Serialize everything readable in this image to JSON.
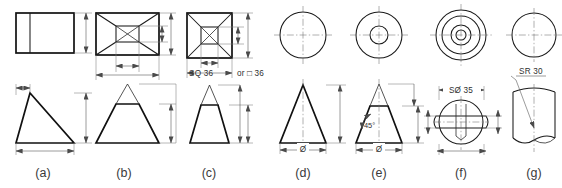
{
  "sheet": {
    "title": "Dimensioning of solids - orthographic views",
    "width": 562,
    "height": 188,
    "background": "#ffffff",
    "line_color": "#1a1a1a",
    "dim_color": "#4a4a4a",
    "center_color": "#6f6f6f"
  },
  "panels": [
    {
      "key": "a",
      "caption": "(a)",
      "solid": "oblique-prism",
      "top_view": "rectangle-with-vertical-edge",
      "front_view": "scalene-triangle",
      "dimensions": []
    },
    {
      "key": "b",
      "caption": "(b)",
      "solid": "truncated-rectangular-pyramid",
      "top_view": "rectangle-with-inner-rectangle-and-diagonals",
      "front_view": "trapezoid-with-apex-construction",
      "dimensions": []
    },
    {
      "key": "c",
      "caption": "(c)",
      "solid": "truncated-square-pyramid",
      "top_view": "square-with-inner-square-and-diagonals",
      "front_view": "trapezoid-with-apex-construction",
      "dimensions": [
        {
          "name": "square-size",
          "text": "SQ 36"
        },
        {
          "name": "alternate-note",
          "text": "or"
        },
        {
          "name": "square-symbol-size",
          "text": "□ 36"
        }
      ]
    },
    {
      "key": "d",
      "caption": "(d)",
      "solid": "cone",
      "top_view": "circle",
      "front_view": "isosceles-triangle",
      "dimensions": [
        {
          "name": "base-diameter",
          "text": "Ø"
        }
      ]
    },
    {
      "key": "e",
      "caption": "(e)",
      "solid": "truncated-cone",
      "top_view": "two-concentric-circles",
      "front_view": "trapezoid-with-apex-construction",
      "dimensions": [
        {
          "name": "cone-half-angle",
          "text": "45°"
        },
        {
          "name": "base-diameter",
          "text": "Ø"
        }
      ]
    },
    {
      "key": "f",
      "caption": "(f)",
      "solid": "sphere-with-flange",
      "top_view": "four-concentric-circles",
      "front_view": "sphere-with-equatorial-flange",
      "dimensions": [
        {
          "name": "spherical-diameter",
          "text": "SØ 35"
        }
      ]
    },
    {
      "key": "g",
      "caption": "(g)",
      "solid": "cylinder-with-spherical-radius-cut",
      "top_view": "circle",
      "front_view": "cylinder-with-spherical-cut",
      "dimensions": [
        {
          "name": "spherical-radius",
          "text": "SR 30"
        }
      ]
    }
  ]
}
